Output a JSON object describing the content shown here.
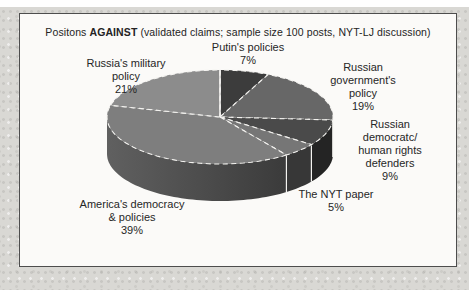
{
  "title": {
    "prefix": "Positons ",
    "bold": "AGAINST",
    "suffix": " (validated claims; sample size 100 posts, NYT-LJ  discussion)"
  },
  "labels": {
    "putin": "Putin's policies\n7%",
    "government": "Russian\ngovernment's policy\n19%",
    "democrats": "Russian democratc/\nhuman rights\ndefenders\n9%",
    "nyt": "The NYT paper\n5%",
    "america": "America's democracy\n& policies\n39%",
    "military": "Russia's military\npolicy\n21%"
  },
  "colors": {
    "page_background": "#d9d8d4",
    "frame_background": "#fbfaf8",
    "frame_border": "#4d4d4d",
    "label_text": "#262626",
    "slice_edge_white": "#f4f3f0"
  },
  "chart_data": {
    "type": "pie",
    "style": "3d",
    "title": "Positons AGAINST (validated claims; sample size 100 posts, NYT-LJ  discussion)",
    "start_angle_deg": 0,
    "direction": "clockwise",
    "legend_position": "none",
    "categories": [
      "Putin's policies",
      "Russian government's policy",
      "Russian democratc/ human rights defenders",
      "The NYT paper",
      "America's democracy & policies",
      "Russia's military policy"
    ],
    "values": [
      7,
      19,
      9,
      5,
      39,
      21
    ],
    "slices": [
      {
        "label": "Putin's policies",
        "pct": 7,
        "value": 7,
        "color": "#3c3c3c",
        "side_color": "#222222"
      },
      {
        "label": "Russian government's policy",
        "pct": 19,
        "value": 19,
        "color": "#676767",
        "side_color": "#343434"
      },
      {
        "label": "Russian democratc/ human rights defenders",
        "pct": 9,
        "value": 9,
        "color": "#4a4a4a",
        "side_color": "#242424"
      },
      {
        "label": "The NYT paper",
        "pct": 5,
        "value": 5,
        "color": "#767676",
        "side_color": "#373737"
      },
      {
        "label": "America's democracy & policies",
        "pct": 39,
        "value": 39,
        "color": "#7e7e7e",
        "side_gradient": [
          "#606060",
          "#313131"
        ],
        "side_color": "#4a4a4a"
      },
      {
        "label": "Russia's military policy",
        "pct": 21,
        "value": 21,
        "color": "#8c8c8c",
        "side_color": "#555555"
      }
    ]
  }
}
